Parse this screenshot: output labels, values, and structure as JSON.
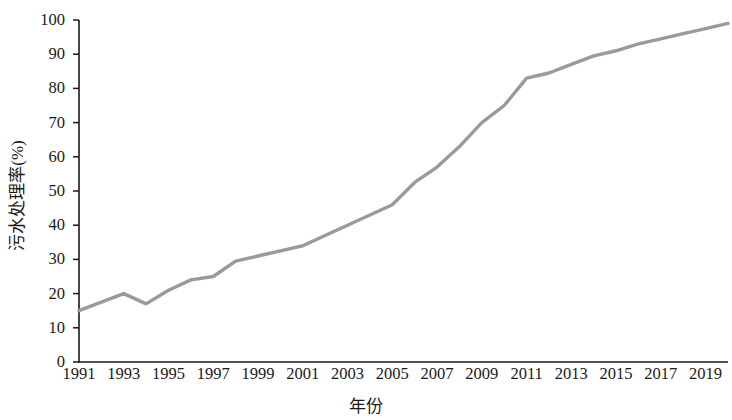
{
  "chart_data": {
    "type": "line",
    "title": "",
    "xlabel": "年份",
    "ylabel": "污水处理率(%)",
    "xlim": [
      1991,
      2020
    ],
    "ylim": [
      0,
      100
    ],
    "grid": false,
    "legend": "none",
    "line_color": "#9a9a9a",
    "axis_color": "#1a1a1a",
    "y_ticks": [
      0,
      10,
      20,
      30,
      40,
      50,
      60,
      70,
      80,
      90,
      100
    ],
    "y_tick_labels": [
      "0",
      "10",
      "20",
      "30",
      "40",
      "50",
      "60",
      "70",
      "80",
      "90",
      "100"
    ],
    "x_ticks": [
      1991,
      1993,
      1995,
      1997,
      1999,
      2001,
      2003,
      2005,
      2007,
      2009,
      2011,
      2013,
      2015,
      2017,
      2019
    ],
    "x_tick_labels": [
      "1991",
      "1993",
      "1995",
      "1997",
      "1999",
      "2001",
      "2003",
      "2005",
      "2007",
      "2009",
      "2011",
      "2013",
      "2015",
      "2017",
      "2019"
    ],
    "x": [
      1991,
      1992,
      1993,
      1994,
      1995,
      1996,
      1997,
      1998,
      1999,
      2000,
      2001,
      2002,
      2003,
      2004,
      2005,
      2006,
      2007,
      2008,
      2009,
      2010,
      2011,
      2012,
      2013,
      2014,
      2015,
      2016,
      2017,
      2018,
      2019,
      2020
    ],
    "values": [
      15,
      17.5,
      20,
      17,
      21,
      24,
      25,
      29.5,
      31,
      32.5,
      34,
      37,
      40,
      43,
      46,
      52.5,
      57,
      63,
      70,
      75,
      83,
      84.5,
      87,
      89.5,
      91,
      93,
      94.5,
      96,
      97.5,
      99
    ],
    "series": [
      {
        "name": "污水处理率",
        "values": [
          15,
          17.5,
          20,
          17,
          21,
          24,
          25,
          29.5,
          31,
          32.5,
          34,
          37,
          40,
          43,
          46,
          52.5,
          57,
          63,
          70,
          75,
          83,
          84.5,
          87,
          89.5,
          91,
          93,
          94.5,
          96,
          97.5,
          99
        ]
      }
    ]
  }
}
